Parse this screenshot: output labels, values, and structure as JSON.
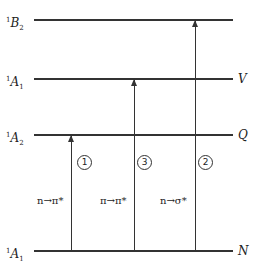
{
  "levels": [
    {
      "sym": "B",
      "sup": "1",
      "sub": "2",
      "right": "",
      "y": 20
    },
    {
      "sym": "A",
      "sup": "1",
      "sub": "1",
      "right": "V",
      "y": 79
    },
    {
      "sym": "A",
      "sup": "1",
      "sub": "2",
      "right": "Q",
      "y": 135
    },
    {
      "sym": "A",
      "sup": "1",
      "sub": "1",
      "right": "N",
      "y": 251
    }
  ],
  "transitions": [
    {
      "num": "1",
      "label": "n→π*"
    },
    {
      "num": "3",
      "label": "π→π*"
    },
    {
      "num": "2",
      "label": "n→σ*"
    }
  ]
}
